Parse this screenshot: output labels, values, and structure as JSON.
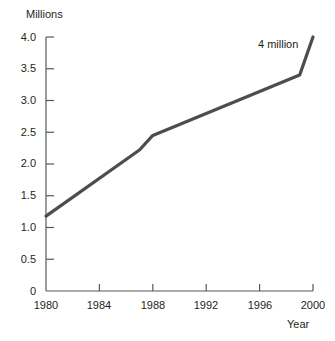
{
  "chart_data": {
    "type": "line",
    "title": "",
    "xlabel": "Year",
    "ylabel": "Millions",
    "xlim": [
      1980,
      2000
    ],
    "ylim": [
      0,
      4.0
    ],
    "grid": false,
    "legend": "none",
    "line_color": "#4d4d4d",
    "x_ticks": [
      "1980",
      "1984",
      "1988",
      "1992",
      "1996",
      "2000"
    ],
    "x_tick_values": [
      1980,
      1984,
      1988,
      1992,
      1996,
      2000
    ],
    "y_ticks": [
      "0",
      "0.5",
      "1.0",
      "1.5",
      "2.0",
      "2.5",
      "3.0",
      "3.5",
      "4.0"
    ],
    "y_tick_values": [
      0,
      0.5,
      1.0,
      1.5,
      2.0,
      2.5,
      3.0,
      3.5,
      4.0
    ],
    "series": [
      {
        "name": "Millions",
        "x": [
          1980,
          1987,
          1988,
          1999,
          2000
        ],
        "values": [
          1.18,
          2.22,
          2.45,
          3.4,
          4.0
        ]
      }
    ],
    "annotations": [
      {
        "text": "4 million",
        "x": 1999,
        "y": 3.95
      }
    ]
  }
}
